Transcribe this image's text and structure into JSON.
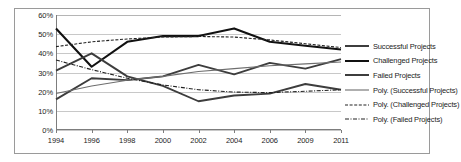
{
  "chart_data": {
    "type": "line",
    "title": "",
    "subtitle": "",
    "xlabel": "",
    "ylabel": "",
    "x": [
      "1994",
      "1996",
      "1998",
      "2000",
      "2002",
      "2004",
      "2006",
      "2009",
      "2011"
    ],
    "categories": [
      "1994",
      "1996",
      "1998",
      "2000",
      "2002",
      "2004",
      "2006",
      "2009",
      "2011"
    ],
    "ylim": [
      0,
      60
    ],
    "ytick_labels": [
      "0%",
      "10%",
      "20%",
      "30%",
      "40%",
      "50%",
      "60%"
    ],
    "ytick_values": [
      0,
      10,
      20,
      30,
      40,
      50,
      60
    ],
    "grid": true,
    "legend_position": "right",
    "series": [
      {
        "name": "Successful Projects",
        "style": "solid",
        "color": "#3d3d3d",
        "width": 1.9,
        "values": [
          16,
          27,
          26,
          28,
          34,
          29,
          35,
          32,
          37
        ]
      },
      {
        "name": "Challenged Projects",
        "style": "solid",
        "color": "#111111",
        "width": 2.1,
        "values": [
          53,
          33,
          46,
          49,
          49,
          53,
          46,
          44,
          42
        ]
      },
      {
        "name": "Failed Projects",
        "style": "solid",
        "color": "#3d3d3d",
        "width": 1.9,
        "values": [
          31,
          40,
          28,
          23,
          15,
          18,
          19,
          24,
          21
        ]
      },
      {
        "name": "Poly. (Successful Projects)",
        "style": "trend-solid",
        "color": "#6e6e6e",
        "width": 1.1,
        "values": [
          19,
          23,
          26,
          28,
          30.5,
          32,
          33.5,
          34.5,
          35.5
        ]
      },
      {
        "name": "Poly. (Challenged Projects)",
        "style": "dashed",
        "color": "#222222",
        "width": 1.1,
        "values": [
          43.5,
          46,
          47.5,
          48.5,
          48.8,
          48.5,
          47,
          45,
          43
        ]
      },
      {
        "name": "Poly. (Failed Projects)",
        "style": "dash-dot",
        "color": "#222222",
        "width": 1.1,
        "values": [
          36.5,
          31.5,
          27,
          23.5,
          21,
          19.8,
          19.5,
          20.2,
          21
        ]
      }
    ],
    "legend": [
      {
        "label": "Successful Projects",
        "style": "solid",
        "color": "#3d3d3d"
      },
      {
        "label": "Challenged Projects",
        "style": "solid",
        "color": "#111111"
      },
      {
        "label": "Failed Projects",
        "style": "solid",
        "color": "#3d3d3d"
      },
      {
        "label": "Poly. (Successful Projects)",
        "style": "trend-solid",
        "color": "#6e6e6e"
      },
      {
        "label": "Poly. (Challenged Projects)",
        "style": "dashed",
        "color": "#222222"
      },
      {
        "label": "Poly. (Failed Projects)",
        "style": "dash-dot",
        "color": "#222222"
      }
    ]
  }
}
